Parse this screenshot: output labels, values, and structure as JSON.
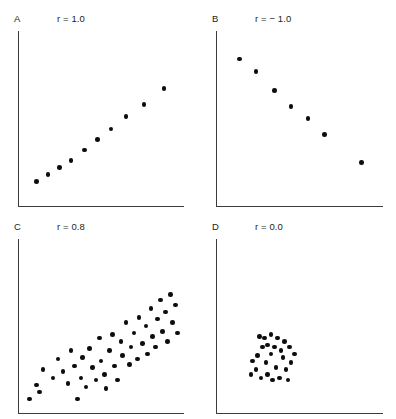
{
  "figure": {
    "title": "",
    "background_color": "#ffffff",
    "dot_color": "#0d0d0d",
    "axis_color": "#3c3c3c",
    "layout": "2x2 grid of scatterplots illustrating correlation coefficients"
  },
  "panels": {
    "a": {
      "label": "A",
      "r_text": "r = 1.0"
    },
    "b": {
      "label": "B",
      "r_text": "r = − 1.0"
    },
    "c": {
      "label": "C",
      "r_text": "r = 0.8"
    },
    "d": {
      "label": "D",
      "r_text": "r = 0.0"
    }
  },
  "chart_data": [
    {
      "type": "scatter",
      "panel": "A",
      "title": "A",
      "annotation": "r = 1.0",
      "correlation": 1.0,
      "xlabel": "",
      "ylabel": "",
      "xlim": [
        0,
        100
      ],
      "ylim": [
        0,
        100
      ],
      "grid": false,
      "legend": "none",
      "n_points": 10,
      "points": [
        [
          11,
          14
        ],
        [
          18,
          18
        ],
        [
          25,
          22
        ],
        [
          32,
          26
        ],
        [
          40,
          32
        ],
        [
          48,
          38
        ],
        [
          56,
          44
        ],
        [
          65,
          51
        ],
        [
          76,
          58
        ],
        [
          88,
          67
        ]
      ]
    },
    {
      "type": "scatter",
      "panel": "B",
      "title": "B",
      "annotation": "r = − 1.0",
      "correlation": -1.0,
      "xlabel": "",
      "ylabel": "",
      "xlim": [
        0,
        100
      ],
      "ylim": [
        0,
        100
      ],
      "grid": false,
      "legend": "none",
      "n_points": 7,
      "points": [
        [
          14,
          84
        ],
        [
          24,
          77
        ],
        [
          35,
          66
        ],
        [
          45,
          57
        ],
        [
          55,
          50
        ],
        [
          65,
          41
        ],
        [
          87,
          25
        ]
      ]
    },
    {
      "type": "scatter",
      "panel": "C",
      "title": "C",
      "annotation": "r = 0.8",
      "correlation": 0.8,
      "xlabel": "",
      "ylabel": "",
      "xlim": [
        0,
        100
      ],
      "ylim": [
        0,
        100
      ],
      "grid": false,
      "legend": "none",
      "n_points": 48,
      "points": [
        [
          7,
          8
        ],
        [
          11,
          16
        ],
        [
          13,
          12
        ],
        [
          15,
          25
        ],
        [
          21,
          20
        ],
        [
          24,
          31
        ],
        [
          27,
          24
        ],
        [
          30,
          17
        ],
        [
          32,
          36
        ],
        [
          34,
          27
        ],
        [
          36,
          8
        ],
        [
          38,
          20
        ],
        [
          39,
          32
        ],
        [
          41,
          15
        ],
        [
          43,
          37
        ],
        [
          45,
          26
        ],
        [
          47,
          19
        ],
        [
          49,
          43
        ],
        [
          50,
          30
        ],
        [
          52,
          22
        ],
        [
          53,
          14
        ],
        [
          55,
          36
        ],
        [
          57,
          45
        ],
        [
          58,
          27
        ],
        [
          60,
          19
        ],
        [
          62,
          41
        ],
        [
          63,
          33
        ],
        [
          65,
          52
        ],
        [
          67,
          28
        ],
        [
          68,
          38
        ],
        [
          70,
          46
        ],
        [
          72,
          31
        ],
        [
          73,
          55
        ],
        [
          75,
          40
        ],
        [
          77,
          50
        ],
        [
          78,
          34
        ],
        [
          80,
          60
        ],
        [
          81,
          44
        ],
        [
          83,
          38
        ],
        [
          84,
          54
        ],
        [
          86,
          65
        ],
        [
          87,
          47
        ],
        [
          89,
          58
        ],
        [
          90,
          41
        ],
        [
          92,
          68
        ],
        [
          93,
          52
        ],
        [
          95,
          62
        ],
        [
          96,
          46
        ]
      ]
    },
    {
      "type": "scatter",
      "panel": "D",
      "title": "D",
      "annotation": "r = 0.0",
      "correlation": 0.0,
      "xlabel": "",
      "ylabel": "",
      "xlim": [
        0,
        100
      ],
      "ylim": [
        0,
        100
      ],
      "grid": false,
      "legend": "none",
      "n_points": 26,
      "points": [
        [
          40,
          32
        ],
        [
          36,
          26
        ],
        [
          33,
          34
        ],
        [
          30,
          29
        ],
        [
          28,
          38
        ],
        [
          25,
          33
        ],
        [
          24,
          25
        ],
        [
          22,
          30
        ],
        [
          27,
          20
        ],
        [
          31,
          22
        ],
        [
          34,
          19
        ],
        [
          38,
          20
        ],
        [
          42,
          25
        ],
        [
          45,
          29
        ],
        [
          47,
          34
        ],
        [
          44,
          38
        ],
        [
          41,
          41
        ],
        [
          37,
          43
        ],
        [
          33,
          45
        ],
        [
          29,
          43
        ],
        [
          26,
          44
        ],
        [
          35,
          38
        ],
        [
          39,
          36
        ],
        [
          31,
          39
        ],
        [
          43,
          19
        ],
        [
          21,
          22
        ]
      ]
    }
  ]
}
